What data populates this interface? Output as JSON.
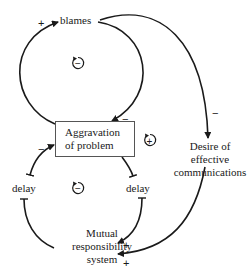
{
  "nodes": {
    "blames": "blames",
    "aggravation": {
      "line1": "Aggravation",
      "line2": "of problem"
    },
    "desire": {
      "line1": "Desire of",
      "line2": "effective",
      "line3": "communications"
    },
    "delay_left": "delay",
    "delay_right": "delay",
    "mutual": {
      "line1": "Mutual",
      "line2": "responsibility",
      "line3": "system"
    }
  },
  "links": [
    {
      "from": "aggravation",
      "to": "blames",
      "polarity": "+"
    },
    {
      "from": "blames",
      "to": "aggravation",
      "polarity": "−"
    },
    {
      "from": "blames",
      "to": "desire",
      "polarity": "−"
    },
    {
      "from": "desire",
      "to": "mutual",
      "polarity": "+"
    },
    {
      "from": "aggravation",
      "to": "delay_right",
      "polarity": ""
    },
    {
      "from": "delay_right",
      "to": "mutual",
      "polarity": "+"
    },
    {
      "from": "mutual",
      "to": "delay_left",
      "polarity": ""
    },
    {
      "from": "delay_left",
      "to": "aggravation",
      "polarity": "−"
    }
  ],
  "signs": {
    "blames_in": "+",
    "aggr_in_top": "−",
    "desire_in": "−",
    "aggr_in_left": "−",
    "mutual_in_1": "+",
    "mutual_in_2": "+"
  },
  "loops": {
    "top": "−",
    "right": "+",
    "bottom": "−"
  },
  "colors": {
    "line": "#1a1a1a",
    "box_border": "#555555"
  }
}
